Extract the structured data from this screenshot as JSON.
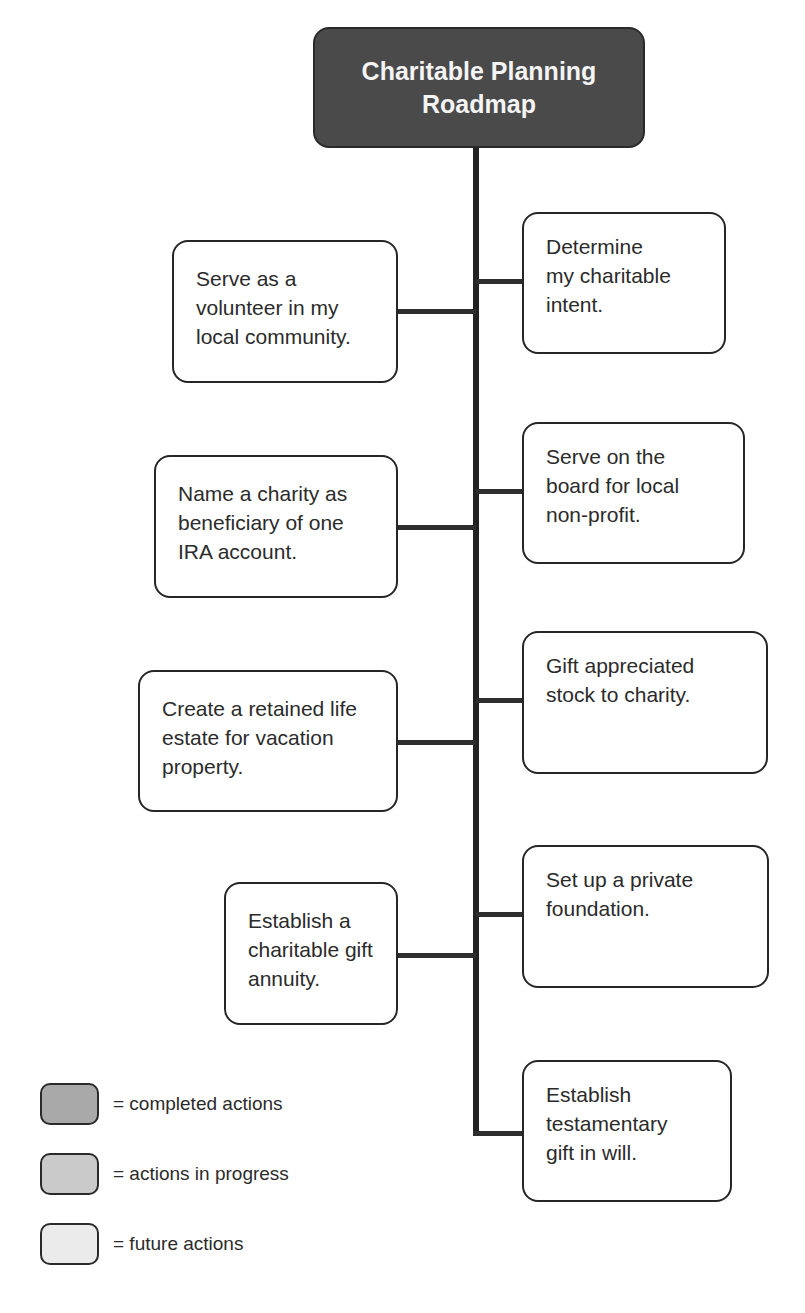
{
  "title": "Charitable Planning\nRoadmap",
  "colors": {
    "title_fill": "#4a4a4a",
    "completed": "#a9a9a9",
    "in_progress": "#c9c9c9",
    "future": "#ececec",
    "node_fill": "#ffffff",
    "line": "#222222"
  },
  "right_nodes": [
    {
      "text": "Determine\nmy charitable\nintent."
    },
    {
      "text": "Serve on the\nboard for local\nnon-profit."
    },
    {
      "text": "Gift appreciated\nstock to charity."
    },
    {
      "text": "Set up a private\nfoundation."
    },
    {
      "text": "Establish\ntestamentary\ngift in will."
    }
  ],
  "left_nodes": [
    {
      "text": "Serve as a\nvolunteer in my\nlocal community."
    },
    {
      "text": "Name a charity as\nbeneficiary of one\nIRA account."
    },
    {
      "text": "Create a retained life\nestate for vacation\nproperty."
    },
    {
      "text": "Establish a\ncharitable gift\nannuity."
    }
  ],
  "legend": [
    {
      "label": "= completed actions",
      "status": "completed"
    },
    {
      "label": "= actions in progress",
      "status": "in_progress"
    },
    {
      "label": "= future actions",
      "status": "future"
    }
  ]
}
